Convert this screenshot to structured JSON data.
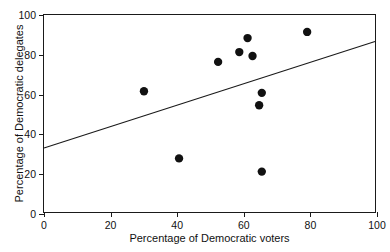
{
  "chart_data": {
    "type": "scatter",
    "title": "",
    "xlabel": "Percentage of Democratic voters",
    "ylabel": "Percentage of Democratic delegates",
    "xlim": [
      0,
      100
    ],
    "ylim": [
      0,
      100
    ],
    "xticks": [
      0,
      20,
      40,
      60,
      80,
      100
    ],
    "yticks": [
      0,
      20,
      40,
      60,
      80,
      100
    ],
    "xtick_labels": [
      "0",
      "20",
      "40",
      "60",
      "80",
      "100"
    ],
    "ytick_labels": [
      "0",
      "20",
      "40",
      "60",
      "80",
      "100"
    ],
    "grid": false,
    "legend": null,
    "points": [
      {
        "x": 30.2,
        "y": 61.3
      },
      {
        "x": 40.8,
        "y": 27.2
      },
      {
        "x": 52.6,
        "y": 76.2
      },
      {
        "x": 59.0,
        "y": 81.2
      },
      {
        "x": 61.5,
        "y": 88.3
      },
      {
        "x": 63.0,
        "y": 79.2
      },
      {
        "x": 65.0,
        "y": 54.2
      },
      {
        "x": 65.8,
        "y": 60.5
      },
      {
        "x": 65.8,
        "y": 20.5
      },
      {
        "x": 79.5,
        "y": 91.4
      }
    ],
    "trendline": {
      "x0": 0,
      "y0": 32.5,
      "x1": 100,
      "y1": 86.5
    },
    "marker": {
      "shape": "circle",
      "size": 4.2,
      "color": "#111111"
    },
    "line_color": "#1a1a1a",
    "axis_color": "#1a1a1a",
    "background": "#ffffff"
  }
}
